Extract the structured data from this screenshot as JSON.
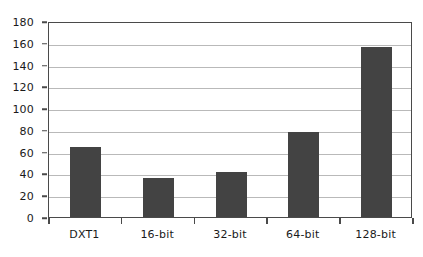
{
  "chart_data": {
    "type": "bar",
    "title": "",
    "subtitle": "",
    "xlabel": "",
    "ylabel": "",
    "categories": [
      "DXT1",
      "16-bit",
      "32-bit",
      "64-bit",
      "128-bit"
    ],
    "values": [
      64,
      36,
      41,
      78,
      156
    ],
    "series": [
      {
        "name": "",
        "values": [
          64,
          36,
          41,
          78,
          156
        ]
      }
    ],
    "ylim": [
      0,
      180
    ],
    "ytick_step": 20,
    "yticks": [
      0,
      20,
      40,
      60,
      80,
      100,
      120,
      140,
      160,
      180
    ],
    "ytick_labels": [
      "0",
      "20",
      "40",
      "60",
      "80",
      "100",
      "120",
      "140",
      "160",
      "180"
    ],
    "grid": true,
    "grid_axis": "y",
    "legend": false,
    "legend_position": "none",
    "annotations": [],
    "colors": {
      "bar_fill": "#434343",
      "gridline": "#b9b9b9",
      "axis_line": "#4a4a4a",
      "text": "#1a1a1a",
      "background": "#ffffff"
    }
  }
}
